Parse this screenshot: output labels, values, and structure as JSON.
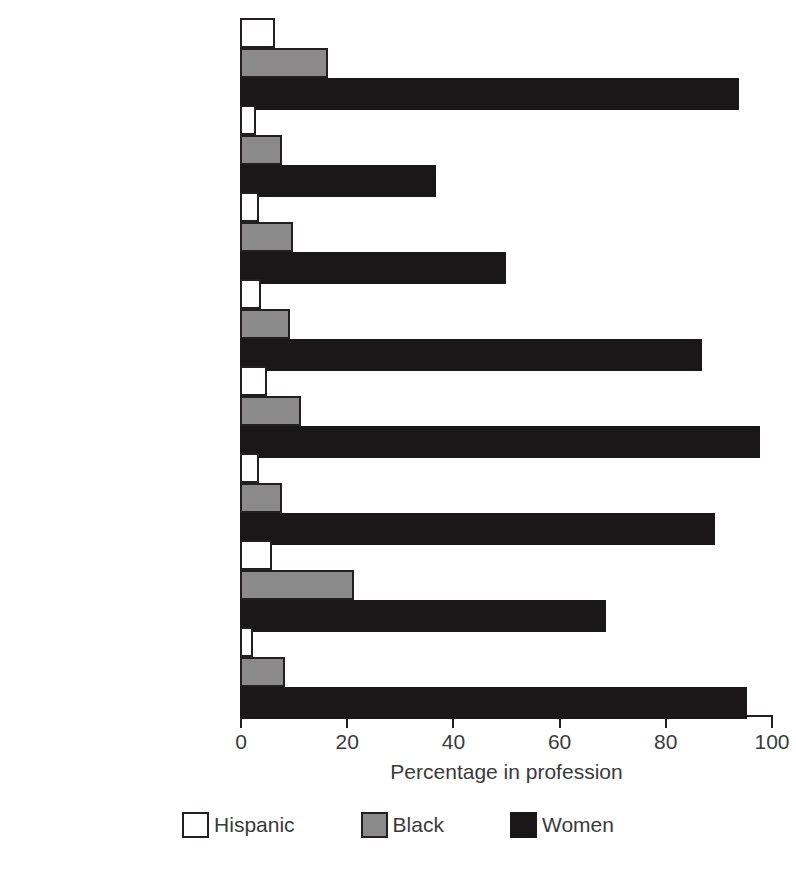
{
  "chart_data": {
    "type": "bar",
    "orientation": "horizontal",
    "title": "",
    "xlabel": "Percentage in profession",
    "ylabel": "",
    "xlim": [
      0,
      100
    ],
    "xticks": [
      0,
      20,
      40,
      60,
      80,
      100
    ],
    "grid": false,
    "legend_position": "bottom",
    "categories": [
      "Dietitians",
      "Pharmacists",
      "Secondary teachers",
      "Elementary teachers",
      "Nursery school and\nkindergarten teachers",
      "Librarians",
      "Social workers",
      "Registered nurses"
    ],
    "series": [
      {
        "name": "Hispanic",
        "color": "#ffffff",
        "values": [
          6.5,
          3,
          3.5,
          4,
          5,
          3.5,
          6,
          2.5
        ]
      },
      {
        "name": "Black",
        "color": "#8a8a8a",
        "values": [
          16.5,
          8,
          10,
          9.5,
          11.5,
          8,
          21.5,
          8.5
        ]
      },
      {
        "name": "Women",
        "color": "#1a1718",
        "values": [
          94,
          37,
          50,
          87,
          98,
          89.5,
          69,
          95.5
        ]
      }
    ]
  },
  "axis": {
    "x_title": "Percentage in profession",
    "ticks": [
      "0",
      "20",
      "40",
      "60",
      "80",
      "100"
    ]
  },
  "legend": {
    "items": [
      {
        "label": "Hispanic",
        "swatch": "hispanic"
      },
      {
        "label": "Black",
        "swatch": "black"
      },
      {
        "label": "Women",
        "swatch": "women"
      }
    ]
  }
}
